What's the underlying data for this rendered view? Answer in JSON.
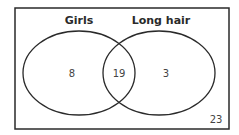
{
  "venn": {
    "sets": [
      {
        "label": "Girls",
        "only_value": "8"
      },
      {
        "label": "Long hair",
        "only_value": "3"
      }
    ],
    "intersection_value": "19",
    "outside_value": "23"
  },
  "colors": {
    "stroke": "#2a2a2a",
    "background": "#ffffff"
  }
}
